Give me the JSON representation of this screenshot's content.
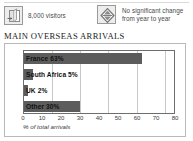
{
  "legend": {
    "items": [
      {
        "icon": "visitor-box-icon",
        "label": "8,000 visitors"
      },
      {
        "icon": "no-change-diamond-icon",
        "label": "No significant change\nfrom year to year"
      }
    ]
  },
  "chart_title": "MAIN OVERSEAS ARRIVALS",
  "colors": {
    "bar": "#5c5c5c",
    "gridline": "#c9c9c9",
    "plot_border": "#6e6e6e",
    "frame_border": "#b9b9b9",
    "icon_fill": "#ededed",
    "icon_stroke": "#9a9a9a"
  },
  "chart_data": {
    "type": "bar",
    "orientation": "horizontal",
    "title": "MAIN OVERSEAS ARRIVALS",
    "xlabel": "% of total arrivals",
    "ylabel": "",
    "xlim": [
      0,
      80
    ],
    "grid": true,
    "legend": "none",
    "categories": [
      "France",
      "South Africa",
      "UK",
      "Other"
    ],
    "values": [
      63,
      5,
      2,
      30
    ],
    "bar_labels": [
      "France 63%",
      "South Africa 5%",
      "UK 2%",
      "Other 30%"
    ],
    "xticks": [
      0,
      10,
      20,
      30,
      40,
      50,
      60,
      70,
      80
    ],
    "xtick_labels": [
      "0",
      "10",
      "20",
      "30",
      "40",
      "50",
      "60",
      "70",
      "80"
    ]
  }
}
